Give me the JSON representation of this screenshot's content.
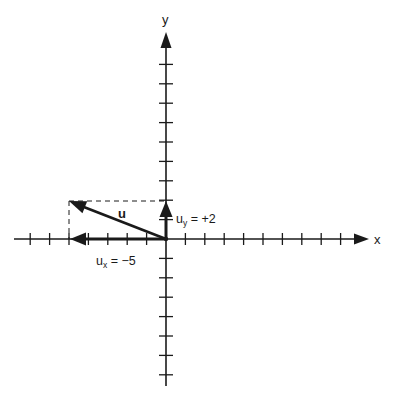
{
  "diagram": {
    "type": "vector-components",
    "axes": {
      "x_label": "x",
      "y_label": "y",
      "origin_px": [
        166,
        239
      ],
      "unit_px": 19.4,
      "x_ticks": [
        -7,
        -6,
        -5,
        -4,
        -3,
        -2,
        -1,
        1,
        2,
        3,
        4,
        5,
        6,
        7,
        8,
        9
      ],
      "y_ticks": [
        -7,
        -6,
        -5,
        -4,
        -3,
        -2,
        -1,
        1,
        2,
        3,
        4,
        5,
        6,
        7,
        8,
        9
      ]
    },
    "vector": {
      "name": "u",
      "components": [
        -5,
        2
      ]
    },
    "labels": {
      "vector": "u",
      "ux_base": "u",
      "ux_sub": "x",
      "ux_value": " = −5",
      "uy_base": "u",
      "uy_sub": "y",
      "uy_value": " = +2"
    },
    "colors": {
      "ink": "#1a1a1a",
      "background": "#ffffff"
    }
  }
}
